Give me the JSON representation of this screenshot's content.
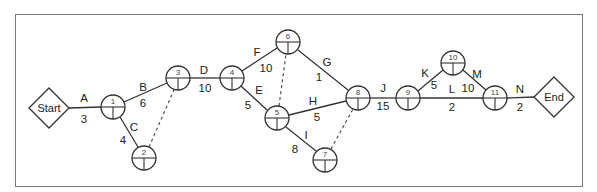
{
  "diagram": {
    "type": "activity-on-arrow network",
    "start": {
      "label": "Start",
      "x": 49,
      "y": 108
    },
    "end": {
      "label": "End",
      "x": 554,
      "y": 97
    },
    "nodes": [
      {
        "id": "1",
        "x": 113,
        "y": 107
      },
      {
        "id": "2",
        "x": 144,
        "y": 158
      },
      {
        "id": "3",
        "x": 178,
        "y": 78
      },
      {
        "id": "4",
        "x": 232,
        "y": 78
      },
      {
        "id": "5",
        "x": 277,
        "y": 118
      },
      {
        "id": "6",
        "x": 288,
        "y": 42
      },
      {
        "id": "7",
        "x": 325,
        "y": 160
      },
      {
        "id": "8",
        "x": 358,
        "y": 98
      },
      {
        "id": "9",
        "x": 408,
        "y": 98
      },
      {
        "id": "10",
        "x": 453,
        "y": 63
      },
      {
        "id": "11",
        "x": 495,
        "y": 98
      }
    ],
    "activities": [
      {
        "name": "A",
        "duration": "3",
        "from": "Start",
        "to": "1"
      },
      {
        "name": "B",
        "duration": "6",
        "from": "1",
        "to": "3"
      },
      {
        "name": "C",
        "duration": "4",
        "from": "1",
        "to": "2"
      },
      {
        "name": "D",
        "duration": "10",
        "from": "3",
        "to": "4"
      },
      {
        "name": "E",
        "duration": "5",
        "from": "4",
        "to": "5"
      },
      {
        "name": "F",
        "duration": "10",
        "from": "4",
        "to": "6"
      },
      {
        "name": "G",
        "duration": "1",
        "from": "6",
        "to": "8"
      },
      {
        "name": "H",
        "duration": "5",
        "from": "5",
        "to": "8"
      },
      {
        "name": "I",
        "duration": "8",
        "from": "5",
        "to": "7"
      },
      {
        "name": "J",
        "duration": "15",
        "from": "8",
        "to": "9"
      },
      {
        "name": "K",
        "duration": "5",
        "from": "9",
        "to": "10"
      },
      {
        "name": "L",
        "duration": "2",
        "from": "9",
        "to": "11"
      },
      {
        "name": "M",
        "duration": "10",
        "from": "10",
        "to": "11"
      },
      {
        "name": "N",
        "duration": "2",
        "from": "11",
        "to": "End"
      }
    ],
    "dummy_activities": [
      {
        "from": "2",
        "to": "3"
      },
      {
        "from": "5",
        "to": "6"
      },
      {
        "from": "7",
        "to": "8"
      }
    ]
  }
}
